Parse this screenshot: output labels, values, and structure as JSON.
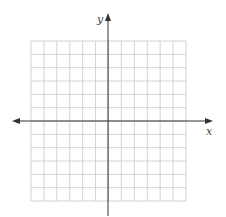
{
  "diagram": {
    "type": "coordinate-plane",
    "grid": {
      "columns": 12,
      "rows": 12,
      "color": "#c8c8c8"
    },
    "axes": {
      "color": "#333333",
      "x_label": "x",
      "y_label": "y",
      "x_arrows": "both",
      "y_arrows": "top"
    }
  }
}
